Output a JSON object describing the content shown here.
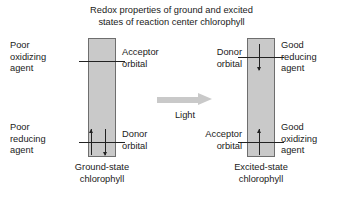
{
  "title": "Redox properties of ground and excited\nstates of reaction center chlorophyll",
  "transition": {
    "arrow_label": "Light",
    "arrow_icon": "right-arrow-icon",
    "arrow_color": "#c9c9c9"
  },
  "ground_state": {
    "caption": "Ground-state\nchlorophyll",
    "box_color": "#c9c9c9",
    "box_border_color": "#6e6e6e",
    "left_labels": {
      "top": "Poor\noxidizing\nagent",
      "bottom": "Poor\nreducing\nagent"
    },
    "orbitals": [
      {
        "name": "acceptor-orbital",
        "label": "Acceptor\norbital",
        "position": "top",
        "electrons": []
      },
      {
        "name": "donor-orbital",
        "label": "Donor\norbital",
        "position": "bottom",
        "electrons": [
          "up",
          "down"
        ]
      }
    ]
  },
  "excited_state": {
    "caption": "Excited-state\nchlorophyll",
    "box_color": "#c9c9c9",
    "box_border_color": "#6e6e6e",
    "right_labels": {
      "top": "Good\nreducing\nagent",
      "bottom": "Good\noxidizing\nagent"
    },
    "orbitals": [
      {
        "name": "donor-orbital",
        "label": "Donor\norbital",
        "position": "top",
        "electrons": [
          "down"
        ]
      },
      {
        "name": "acceptor-orbital",
        "label": "Acceptor\norbital",
        "position": "bottom",
        "electrons": [
          "up"
        ]
      }
    ]
  },
  "colors": {
    "text": "#1a1a1a",
    "box_fill": "#c9c9c9",
    "box_stroke": "#6e6e6e",
    "orbital_line": "#222222",
    "background": "#ffffff"
  }
}
